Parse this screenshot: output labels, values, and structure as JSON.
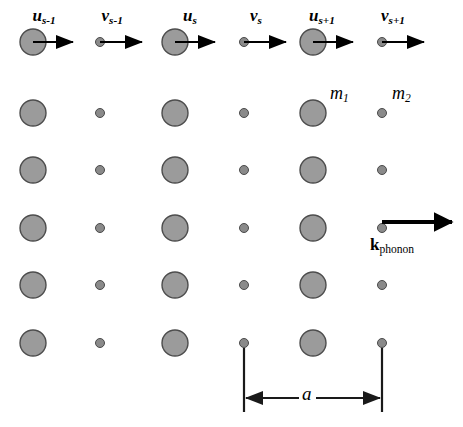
{
  "figure": {
    "width": 463,
    "height": 427,
    "background": "#ffffff"
  },
  "colors": {
    "atom_large_fill": "#9b9b9b",
    "atom_large_stroke": "#4d4d4d",
    "atom_small_fill": "#8a8a8a",
    "atom_small_stroke": "#4a4a4a",
    "arrow": "#000000",
    "dimension": "#1a1a1a"
  },
  "displacement_labels": [
    {
      "symbol": "u",
      "sub": "s-1",
      "x": 44,
      "y": 7
    },
    {
      "symbol": "v",
      "sub": "s-1",
      "x": 112,
      "y": 7
    },
    {
      "symbol": "u",
      "sub": "s",
      "x": 190,
      "y": 7
    },
    {
      "symbol": "v",
      "sub": "s",
      "x": 256,
      "y": 7
    },
    {
      "symbol": "u",
      "sub": "s+1",
      "x": 322,
      "y": 7
    },
    {
      "symbol": "v",
      "sub": "s+1",
      "x": 393,
      "y": 7
    }
  ],
  "mass_labels": [
    {
      "symbol": "m",
      "sub": "1",
      "x": 330,
      "y": 84
    },
    {
      "symbol": "m",
      "sub": "2",
      "x": 392,
      "y": 84
    }
  ],
  "phonon": {
    "symbol": "k",
    "sub": "phonon",
    "label_x": 392,
    "label_y": 236,
    "arrow_x1": 382,
    "arrow_x2": 452,
    "arrow_y": 222
  },
  "lattice_constant": {
    "label": "a",
    "label_x": 307,
    "label_y": 384,
    "x_left": 244,
    "x_right": 382,
    "y_line": 398,
    "tick_top": 348,
    "tick_bottom": 412
  },
  "lattice": {
    "columns_large_x": [
      33,
      175,
      313
    ],
    "columns_small_x": [
      100,
      244,
      382
    ],
    "rows_y": [
      42,
      113,
      170,
      228,
      285,
      343
    ],
    "radius_large": 13,
    "radius_small": 4.5,
    "arrow_row_index": 0,
    "arrow_length_large": 40,
    "arrow_length_small": 42
  }
}
